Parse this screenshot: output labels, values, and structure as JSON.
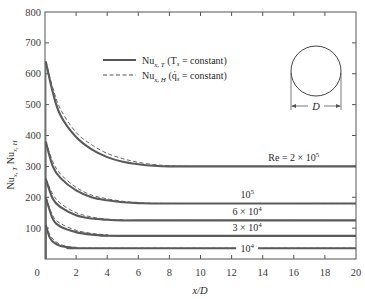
{
  "chart_data": {
    "type": "line",
    "title": "",
    "xlabel": "x/D",
    "ylabel": "Nu_{x,T}  Nu_{x,H}",
    "xlim": [
      0,
      20
    ],
    "ylim": [
      0,
      800
    ],
    "xticks": [
      0,
      2,
      4,
      6,
      8,
      10,
      12,
      14,
      16,
      18,
      20
    ],
    "yticks": [
      0,
      100,
      200,
      300,
      400,
      500,
      600,
      700,
      800
    ],
    "grid": false,
    "legend": {
      "position": "upper-center",
      "entries": [
        {
          "style": "solid",
          "label_main": "Nu",
          "label_sub": "x, T",
          "label_rest": " (T",
          "label_sub2": "s",
          "label_end": " = constant)"
        },
        {
          "style": "dashed",
          "label_main": "Nu",
          "label_sub": "x, H",
          "label_rest": " (q̇",
          "label_sub2": "s",
          "label_end": " = constant)"
        }
      ]
    },
    "inset": {
      "shape": "circle",
      "dimension_label": "D"
    },
    "series": [
      {
        "name": "Re = 2 × 10^5",
        "label": "Re = 2 × 10",
        "label_exp": "5",
        "fully_developed": 300,
        "entrance_value": 640,
        "x": [
          0.05,
          0.5,
          1,
          2,
          3,
          4,
          5,
          6,
          7,
          8,
          10,
          20
        ],
        "y_T": [
          640,
          540,
          465,
          395,
          355,
          330,
          315,
          307,
          302,
          300,
          300,
          300
        ],
        "y_H": [
          640,
          555,
          485,
          410,
          370,
          342,
          325,
          313,
          306,
          302,
          300,
          300
        ]
      },
      {
        "name": "Re = 10^5",
        "label": "10",
        "label_exp": "5",
        "fully_developed": 180,
        "entrance_value": 380,
        "x": [
          0.05,
          0.5,
          1,
          2,
          3,
          4,
          5,
          6,
          8,
          20
        ],
        "y_T": [
          380,
          300,
          262,
          222,
          200,
          190,
          184,
          181,
          180,
          180
        ],
        "y_H": [
          380,
          315,
          275,
          232,
          207,
          195,
          187,
          183,
          180,
          180
        ]
      },
      {
        "name": "Re = 6 × 10^4",
        "label": "6 × 10",
        "label_exp": "4",
        "fully_developed": 125,
        "entrance_value": 260,
        "x": [
          0.05,
          0.5,
          1,
          2,
          3,
          4,
          5,
          6,
          20
        ],
        "y_T": [
          260,
          195,
          168,
          142,
          131,
          127,
          125,
          125,
          125
        ],
        "y_H": [
          260,
          210,
          180,
          150,
          136,
          129,
          126,
          125,
          125
        ]
      },
      {
        "name": "Re = 3 × 10^4",
        "label": "3 × 10",
        "label_exp": "4",
        "fully_developed": 75,
        "entrance_value": 200,
        "x": [
          0.05,
          0.5,
          1,
          2,
          3,
          4,
          5,
          20
        ],
        "y_T": [
          200,
          130,
          105,
          87,
          79,
          76,
          75,
          75
        ],
        "y_H": [
          200,
          140,
          115,
          93,
          83,
          78,
          76,
          75
        ]
      },
      {
        "name": "Re = 10^4",
        "label": "10",
        "label_exp": "4",
        "fully_developed": 35,
        "entrance_value": 110,
        "x": [
          0.05,
          0.3,
          0.6,
          1,
          1.5,
          2,
          3,
          20
        ],
        "y_T": [
          110,
          70,
          52,
          42,
          38,
          36,
          35,
          35
        ],
        "y_H": [
          110,
          80,
          60,
          47,
          40,
          37,
          35,
          35
        ]
      }
    ]
  },
  "labels": {
    "x_axis": "x/D",
    "y_axis_main1": "Nu",
    "y_axis_sub1": "x, T",
    "y_axis_main2": " Nu",
    "y_axis_sub2": "x, H",
    "inset_dim": "D"
  }
}
